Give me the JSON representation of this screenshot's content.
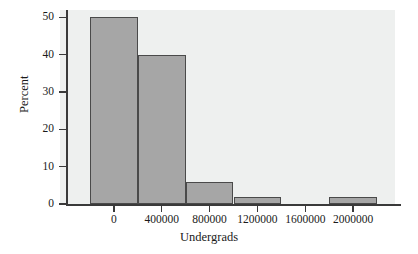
{
  "chart_data": {
    "type": "bar",
    "title": "",
    "subtitle": "",
    "xlabel": "Undergrads",
    "ylabel": "Percent",
    "grid": false,
    "legend": null,
    "legend_position": "none",
    "orientation": "vertical",
    "histogram": true,
    "bin_width": 400000,
    "bin_edges": [
      -200000,
      200000,
      600000,
      1000000,
      1400000,
      1800000,
      2200000
    ],
    "bin_centers": [
      0,
      400000,
      800000,
      1200000,
      1600000,
      2000000
    ],
    "categories": [
      "0",
      "400000",
      "800000",
      "1200000",
      "1600000",
      "2000000"
    ],
    "values": [
      50,
      40,
      6,
      2,
      0,
      2
    ],
    "xlim": [
      -400000,
      2400000
    ],
    "ylim": [
      0,
      52
    ],
    "xticks": [
      0,
      400000,
      800000,
      1200000,
      1600000,
      2000000
    ],
    "xtick_labels": [
      "0",
      "400000",
      "800000",
      "1200000",
      "1600000",
      "2000000"
    ],
    "yticks": [
      0,
      10,
      20,
      30,
      40,
      50
    ],
    "ytick_labels": [
      "0",
      "10",
      "20",
      "30",
      "40",
      "50"
    ],
    "colors": {
      "bar_fill": "#a6a6a6",
      "bar_edge": "#4a4a4a",
      "panel_background": "#eef0ef",
      "figure_background": "#ffffff",
      "axis": "#3a3a3a",
      "text": "#1a1a1a"
    }
  },
  "axes": {
    "y": {
      "title": "Percent",
      "ticks": [
        {
          "label": "50",
          "value": 50
        },
        {
          "label": "40",
          "value": 40
        },
        {
          "label": "30",
          "value": 30
        },
        {
          "label": "20",
          "value": 20
        },
        {
          "label": "10",
          "value": 10
        },
        {
          "label": "0",
          "value": 0
        }
      ]
    },
    "x": {
      "title": "Undergrads",
      "ticks": [
        {
          "label": "0",
          "value": 0
        },
        {
          "label": "400000",
          "value": 400000
        },
        {
          "label": "800000",
          "value": 800000
        },
        {
          "label": "1200000",
          "value": 1200000
        },
        {
          "label": "1600000",
          "value": 1600000
        },
        {
          "label": "2000000",
          "value": 2000000
        }
      ]
    }
  },
  "bars": [
    {
      "center_label": "0",
      "value": 50,
      "value_label": "50"
    },
    {
      "center_label": "400000",
      "value": 40,
      "value_label": "40"
    },
    {
      "center_label": "800000",
      "value": 6,
      "value_label": "6"
    },
    {
      "center_label": "1200000",
      "value": 2,
      "value_label": "2"
    },
    {
      "center_label": "1600000",
      "value": 0,
      "value_label": "0"
    },
    {
      "center_label": "2000000",
      "value": 2,
      "value_label": "2"
    }
  ]
}
